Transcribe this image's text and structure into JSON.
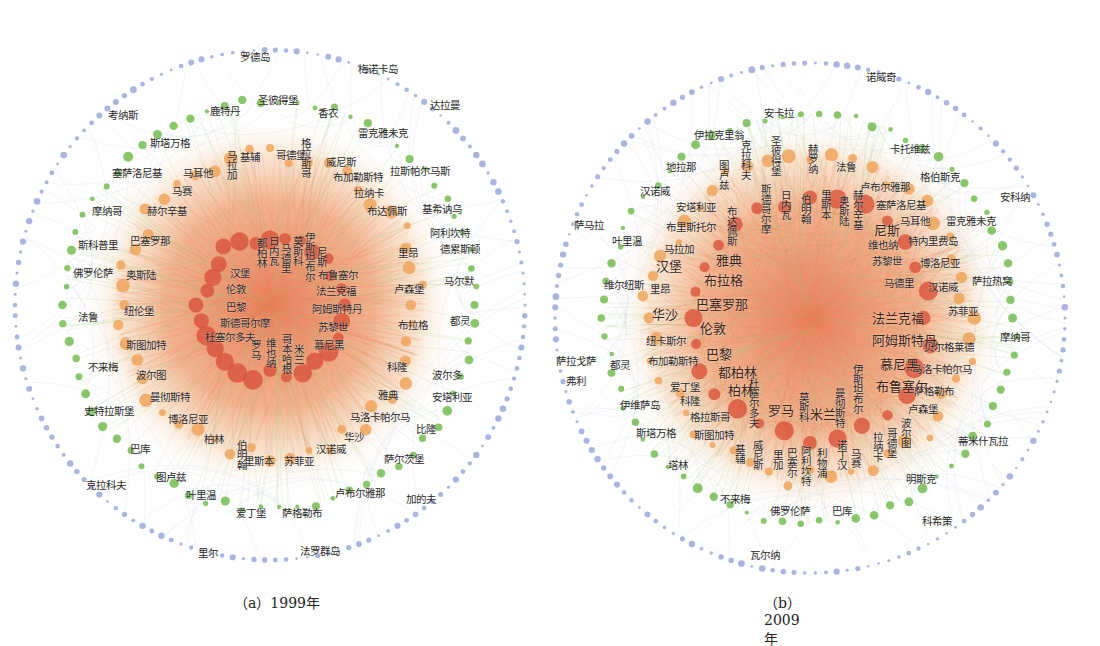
{
  "figure": {
    "panels": [
      {
        "id": "a",
        "caption": "（a）1999年",
        "center": [
          270,
          305
        ],
        "radii": {
          "outer": 255,
          "green": 205,
          "orange": 150,
          "core": 70
        },
        "labels": [
          {
            "t": "罗德岛",
            "x": 240,
            "y": 52
          },
          {
            "t": "梅诺卡岛",
            "x": 358,
            "y": 64
          },
          {
            "t": "考纳斯",
            "x": 108,
            "y": 110
          },
          {
            "t": "达拉曼",
            "x": 430,
            "y": 100
          },
          {
            "t": "鹿特丹",
            "x": 210,
            "y": 106
          },
          {
            "t": "圣彼得堡",
            "x": 258,
            "y": 95
          },
          {
            "t": "香农",
            "x": 318,
            "y": 108
          },
          {
            "t": "斯塔万格",
            "x": 150,
            "y": 138
          },
          {
            "t": "雷克雅未克",
            "x": 358,
            "y": 128
          },
          {
            "t": "基辅",
            "x": 240,
            "y": 152
          },
          {
            "t": "哥德堡",
            "x": 276,
            "y": 150
          },
          {
            "t": "威尼斯",
            "x": 326,
            "y": 157
          },
          {
            "t": "塞萨洛尼基",
            "x": 112,
            "y": 168
          },
          {
            "t": "马耳他",
            "x": 183,
            "y": 168
          },
          {
            "t": "布加勒斯特",
            "x": 333,
            "y": 172
          },
          {
            "t": "拉斯帕尔马斯",
            "x": 390,
            "y": 166
          },
          {
            "t": "马赛",
            "x": 172,
            "y": 186
          },
          {
            "t": "拉纳卡",
            "x": 354,
            "y": 188
          },
          {
            "t": "摩纳哥",
            "x": 92,
            "y": 206
          },
          {
            "t": "赫尔辛基",
            "x": 147,
            "y": 206
          },
          {
            "t": "布达佩斯",
            "x": 367,
            "y": 206
          },
          {
            "t": "基希讷乌",
            "x": 422,
            "y": 204
          },
          {
            "t": "阿利坎特",
            "x": 430,
            "y": 228
          },
          {
            "t": "斯科普里",
            "x": 78,
            "y": 240
          },
          {
            "t": "巴塞罗那",
            "x": 130,
            "y": 236
          },
          {
            "t": "德累斯顿",
            "x": 440,
            "y": 244
          },
          {
            "t": "里昂",
            "x": 398,
            "y": 248
          },
          {
            "t": "佛罗伦萨",
            "x": 73,
            "y": 268
          },
          {
            "t": "奥斯陆",
            "x": 126,
            "y": 270
          },
          {
            "t": "马尔默",
            "x": 444,
            "y": 276
          },
          {
            "t": "卢森堡",
            "x": 394,
            "y": 284
          },
          {
            "t": "法鲁",
            "x": 78,
            "y": 312
          },
          {
            "t": "纽伦堡",
            "x": 124,
            "y": 306
          },
          {
            "t": "布拉格",
            "x": 398,
            "y": 320
          },
          {
            "t": "都灵",
            "x": 450,
            "y": 316
          },
          {
            "t": "斯图加特",
            "x": 126,
            "y": 340
          },
          {
            "t": "不来梅",
            "x": 88,
            "y": 362
          },
          {
            "t": "波尔图",
            "x": 136,
            "y": 370
          },
          {
            "t": "科隆",
            "x": 387,
            "y": 362
          },
          {
            "t": "波尔多",
            "x": 432,
            "y": 370
          },
          {
            "t": "曼彻斯特",
            "x": 150,
            "y": 392
          },
          {
            "t": "雅典",
            "x": 378,
            "y": 390
          },
          {
            "t": "安塔利亚",
            "x": 432,
            "y": 392
          },
          {
            "t": "史特拉斯堡",
            "x": 84,
            "y": 406
          },
          {
            "t": "博洛尼亚",
            "x": 168,
            "y": 414
          },
          {
            "t": "马洛卡帕尔马",
            "x": 350,
            "y": 412
          },
          {
            "t": "比隆",
            "x": 416,
            "y": 424
          },
          {
            "t": "柏林",
            "x": 204,
            "y": 434
          },
          {
            "t": "华沙",
            "x": 344,
            "y": 432
          },
          {
            "t": "巴库",
            "x": 130,
            "y": 444
          },
          {
            "t": "汉诺威",
            "x": 316,
            "y": 444
          },
          {
            "t": "里斯本",
            "x": 244,
            "y": 456
          },
          {
            "t": "苏菲亚",
            "x": 284,
            "y": 456
          },
          {
            "t": "萨尔茨堡",
            "x": 384,
            "y": 454
          },
          {
            "t": "图卢兹",
            "x": 156,
            "y": 472
          },
          {
            "t": "克拉科夫",
            "x": 86,
            "y": 480
          },
          {
            "t": "卢布尔雅那",
            "x": 335,
            "y": 488
          },
          {
            "t": "加的夫",
            "x": 406,
            "y": 494
          },
          {
            "t": "叶里温",
            "x": 186,
            "y": 490
          },
          {
            "t": "爱丁堡",
            "x": 236,
            "y": 508
          },
          {
            "t": "萨格勒布",
            "x": 282,
            "y": 508
          },
          {
            "t": "里尔",
            "x": 198,
            "y": 548
          },
          {
            "t": "法罗群岛",
            "x": 300,
            "y": 546
          }
        ],
        "vlabels": [
          {
            "t": "格拉斯哥",
            "x": 300,
            "y": 138
          },
          {
            "t": "马拉加",
            "x": 226,
            "y": 150
          },
          {
            "t": "伯明翰",
            "x": 236,
            "y": 440
          },
          {
            "t": "都柏林",
            "x": 256,
            "y": 238
          },
          {
            "t": "日内瓦",
            "x": 268,
            "y": 236
          },
          {
            "t": "马德里",
            "x": 280,
            "y": 243
          },
          {
            "t": "莫斯科",
            "x": 292,
            "y": 236
          },
          {
            "t": "伊斯坦布尔",
            "x": 304,
            "y": 232
          },
          {
            "t": "尼斯",
            "x": 316,
            "y": 247
          },
          {
            "t": "罗马",
            "x": 250,
            "y": 340
          },
          {
            "t": "维也纳",
            "x": 265,
            "y": 338
          },
          {
            "t": "哥本哈根",
            "x": 281,
            "y": 334
          },
          {
            "t": "米兰",
            "x": 293,
            "y": 344
          }
        ],
        "core_labels": [
          {
            "t": "汉堡",
            "x": 230,
            "y": 268
          },
          {
            "t": "伦敦",
            "x": 226,
            "y": 284
          },
          {
            "t": "巴黎",
            "x": 226,
            "y": 302
          },
          {
            "t": "斯德哥尔摩",
            "x": 220,
            "y": 318
          },
          {
            "t": "杜塞尔多夫",
            "x": 205,
            "y": 332
          },
          {
            "t": "布鲁塞尔",
            "x": 318,
            "y": 270
          },
          {
            "t": "法兰克福",
            "x": 316,
            "y": 286
          },
          {
            "t": "阿姆斯特丹",
            "x": 312,
            "y": 304
          },
          {
            "t": "苏黎世",
            "x": 318,
            "y": 322
          },
          {
            "t": "慕尼黑",
            "x": 314,
            "y": 340
          }
        ]
      },
      {
        "id": "b",
        "caption": "（b）2009年",
        "center": [
          810,
          318
        ],
        "radii": {
          "outer": 255,
          "green": 205,
          "orange": 160,
          "core": 120
        },
        "labels": [
          {
            "t": "诺威奇",
            "x": 866,
            "y": 72
          },
          {
            "t": "安卡拉",
            "x": 764,
            "y": 108
          },
          {
            "t": "伊拉克里翁",
            "x": 694,
            "y": 130
          },
          {
            "t": "卡托维兹",
            "x": 890,
            "y": 144
          },
          {
            "t": "地拉那",
            "x": 666,
            "y": 162
          },
          {
            "t": "法鲁",
            "x": 836,
            "y": 162
          },
          {
            "t": "卢布尔雅那",
            "x": 860,
            "y": 182
          },
          {
            "t": "格伯斯克",
            "x": 920,
            "y": 172
          },
          {
            "t": "汉诺威",
            "x": 640,
            "y": 186
          },
          {
            "t": "安科纳",
            "x": 1000,
            "y": 192
          },
          {
            "t": "塞萨洛尼基",
            "x": 876,
            "y": 200
          },
          {
            "t": "安塔利亚",
            "x": 676,
            "y": 202
          },
          {
            "t": "萨马拉",
            "x": 574,
            "y": 220
          },
          {
            "t": "马耳他",
            "x": 900,
            "y": 216
          },
          {
            "t": "雷克雅未克",
            "x": 946,
            "y": 216
          },
          {
            "t": "布里斯托尔",
            "x": 666,
            "y": 222
          },
          {
            "t": "叶里温",
            "x": 612,
            "y": 236
          },
          {
            "t": "特内里费岛",
            "x": 908,
            "y": 236
          },
          {
            "t": "马拉加",
            "x": 664,
            "y": 244
          },
          {
            "t": "维也纳",
            "x": 868,
            "y": 240
          },
          {
            "t": "苏黎世",
            "x": 872,
            "y": 256
          },
          {
            "t": "博洛尼亚",
            "x": 920,
            "y": 258
          },
          {
            "t": "马德里",
            "x": 884,
            "y": 278
          },
          {
            "t": "汉诺威",
            "x": 928,
            "y": 282
          },
          {
            "t": "萨拉热窝",
            "x": 972,
            "y": 276
          },
          {
            "t": "维尔纽斯",
            "x": 604,
            "y": 280
          },
          {
            "t": "里昂",
            "x": 650,
            "y": 284
          },
          {
            "t": "苏菲亚",
            "x": 948,
            "y": 306
          },
          {
            "t": "纽卡斯尔",
            "x": 646,
            "y": 336
          },
          {
            "t": "摩纳哥",
            "x": 1000,
            "y": 332
          },
          {
            "t": "贝尔格莱德",
            "x": 924,
            "y": 342
          },
          {
            "t": "萨拉戈萨",
            "x": 556,
            "y": 356
          },
          {
            "t": "都灵",
            "x": 610,
            "y": 360
          },
          {
            "t": "布加勒斯特",
            "x": 648,
            "y": 356
          },
          {
            "t": "马洛卡帕尔马",
            "x": 912,
            "y": 364
          },
          {
            "t": "弗利",
            "x": 566,
            "y": 376
          },
          {
            "t": "爱丁堡",
            "x": 670,
            "y": 382
          },
          {
            "t": "萨格勒布",
            "x": 914,
            "y": 386
          },
          {
            "t": "科隆",
            "x": 680,
            "y": 396
          },
          {
            "t": "伊维萨岛",
            "x": 620,
            "y": 400
          },
          {
            "t": "卢森堡",
            "x": 908,
            "y": 404
          },
          {
            "t": "格拉斯哥",
            "x": 690,
            "y": 412
          },
          {
            "t": "斯塔万格",
            "x": 636,
            "y": 428
          },
          {
            "t": "斯图加特",
            "x": 694,
            "y": 430
          },
          {
            "t": "蒂米什瓦拉",
            "x": 958,
            "y": 436
          },
          {
            "t": "塔林",
            "x": 668,
            "y": 460
          },
          {
            "t": "明斯克",
            "x": 906,
            "y": 474
          },
          {
            "t": "不来梅",
            "x": 720,
            "y": 494
          },
          {
            "t": "佛罗伦萨",
            "x": 770,
            "y": 506
          },
          {
            "t": "巴库",
            "x": 832,
            "y": 506
          },
          {
            "t": "科希策",
            "x": 922,
            "y": 516
          },
          {
            "t": "瓦尔纳",
            "x": 750,
            "y": 550
          }
        ],
        "vlabels": [
          {
            "t": "克拉科夫",
            "x": 740,
            "y": 140
          },
          {
            "t": "圣彼得堡",
            "x": 770,
            "y": 136
          },
          {
            "t": "赫罗纳",
            "x": 807,
            "y": 144
          },
          {
            "t": "图卢兹",
            "x": 718,
            "y": 160
          },
          {
            "t": "斯德哥尔摩",
            "x": 760,
            "y": 184
          },
          {
            "t": "日内瓦",
            "x": 780,
            "y": 190
          },
          {
            "t": "伯明翰",
            "x": 800,
            "y": 194
          },
          {
            "t": "里斯本",
            "x": 820,
            "y": 190
          },
          {
            "t": "奥斯陆",
            "x": 838,
            "y": 196
          },
          {
            "t": "赫尔辛基",
            "x": 852,
            "y": 190
          },
          {
            "t": "布达佩斯",
            "x": 726,
            "y": 206
          },
          {
            "t": "杜塞尔多夫",
            "x": 748,
            "y": 378
          },
          {
            "t": "莫斯科",
            "x": 798,
            "y": 392
          },
          {
            "t": "曼彻斯特",
            "x": 834,
            "y": 388
          },
          {
            "t": "伊斯坦布尔",
            "x": 852,
            "y": 364
          },
          {
            "t": "基辅",
            "x": 734,
            "y": 444
          },
          {
            "t": "威尼斯",
            "x": 752,
            "y": 440
          },
          {
            "t": "里加",
            "x": 772,
            "y": 450
          },
          {
            "t": "巴塞尔",
            "x": 786,
            "y": 448
          },
          {
            "t": "阿利坎特",
            "x": 800,
            "y": 446
          },
          {
            "t": "利物浦",
            "x": 816,
            "y": 448
          },
          {
            "t": "诺丁汉",
            "x": 836,
            "y": 440
          },
          {
            "t": "马赛",
            "x": 850,
            "y": 448
          },
          {
            "t": "拉纳卡",
            "x": 872,
            "y": 432
          },
          {
            "t": "哥德堡",
            "x": 886,
            "y": 428
          },
          {
            "t": "波尔图",
            "x": 900,
            "y": 418
          }
        ],
        "core_labels": [
          {
            "t": "汉堡",
            "x": 656,
            "y": 260
          },
          {
            "t": "雅典",
            "x": 716,
            "y": 254
          },
          {
            "t": "布拉格",
            "x": 704,
            "y": 274
          },
          {
            "t": "巴塞罗那",
            "x": 696,
            "y": 298
          },
          {
            "t": "伦敦",
            "x": 700,
            "y": 322
          },
          {
            "t": "华沙",
            "x": 652,
            "y": 308
          },
          {
            "t": "巴黎",
            "x": 706,
            "y": 348
          },
          {
            "t": "都柏林",
            "x": 718,
            "y": 366
          },
          {
            "t": "柏林",
            "x": 728,
            "y": 384
          },
          {
            "t": "罗马",
            "x": 768,
            "y": 404
          },
          {
            "t": "米兰",
            "x": 810,
            "y": 408
          },
          {
            "t": "布鲁塞尔",
            "x": 876,
            "y": 380
          },
          {
            "t": "慕尼黑",
            "x": 880,
            "y": 358
          },
          {
            "t": "阿姆斯特丹",
            "x": 872,
            "y": 334
          },
          {
            "t": "法兰克福",
            "x": 872,
            "y": 312
          },
          {
            "t": "尼斯",
            "x": 874,
            "y": 224
          }
        ]
      }
    ],
    "legend_colors": {
      "core_node": "#d9533a",
      "orange_node": "#f0a45a",
      "green_node": "#7cc05a",
      "outer_node": "#9aa8d8",
      "core_edge": "#e8875a",
      "mid_edge": "#9ccc78",
      "outer_edge": "#b8c4e6"
    }
  }
}
